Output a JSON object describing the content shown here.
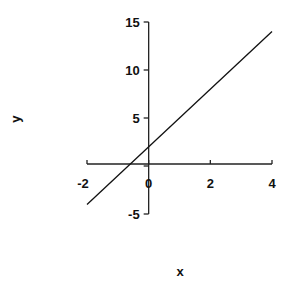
{
  "chart_data": {
    "type": "line",
    "title": "",
    "xlabel": "x",
    "ylabel": "y",
    "xlim": [
      -2,
      4
    ],
    "ylim": [
      -5,
      15
    ],
    "x_ticks": [
      -2,
      0,
      2,
      4
    ],
    "y_ticks": [
      -5,
      0,
      5,
      10,
      15
    ],
    "x_tick_labels": [
      "-2",
      "0",
      "2",
      "4"
    ],
    "y_tick_labels": [
      "-5",
      "5",
      "10",
      "15"
    ],
    "grid": false,
    "legend": null,
    "axes_style": "cross-at-origin",
    "series": [
      {
        "name": "y = 3x + 2",
        "x": [
          -2,
          4
        ],
        "y": [
          -4,
          14
        ],
        "color": "#111111"
      }
    ]
  }
}
